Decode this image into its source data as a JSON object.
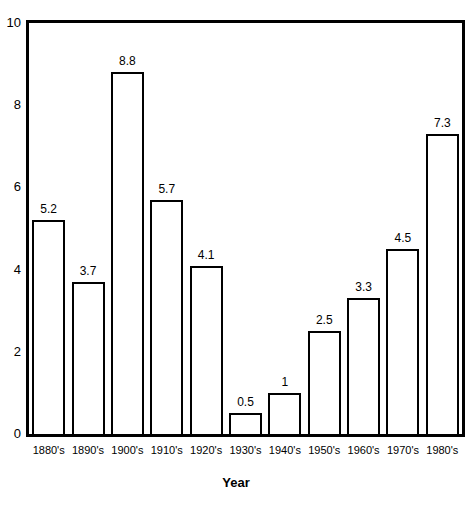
{
  "chart_data": {
    "type": "bar",
    "title": "",
    "subtitle": "",
    "xlabel": "Year",
    "ylabel": "",
    "categories": [
      "1880's",
      "1890's",
      "1900's",
      "1910's",
      "1920's",
      "1930's",
      "1940's",
      "1950's",
      "1960's",
      "1970's",
      "1980's"
    ],
    "values": [
      5.2,
      3.7,
      8.8,
      5.7,
      4.1,
      0.5,
      1,
      2.5,
      3.3,
      4.5,
      7.3
    ],
    "value_labels": [
      "5.2",
      "3.7",
      "8.8",
      "5.7",
      "4.1",
      "0.5",
      "1",
      "2.5",
      "3.3",
      "4.5",
      "7.3"
    ],
    "ylim": [
      0,
      10
    ],
    "yticks": [
      0,
      2,
      4,
      6,
      8,
      10
    ],
    "ytick_labels": [
      "0",
      "2",
      "4",
      "6",
      "8",
      "10"
    ],
    "grid": false,
    "legend": null,
    "bar_style": {
      "fill": "#ffffff",
      "edge": "#000000"
    },
    "frame_color": "#000000",
    "background": "#ffffff"
  }
}
